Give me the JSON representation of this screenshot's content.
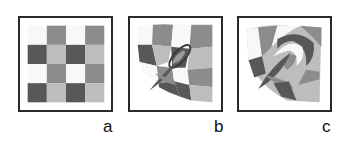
{
  "figure": {
    "panels": [
      {
        "id": "a",
        "label": "a",
        "description": "undistorted 4x4 checkerboard"
      },
      {
        "id": "b",
        "label": "b",
        "description": "checkerboard with moderate swirl distortion"
      },
      {
        "id": "c",
        "label": "c",
        "description": "checkerboard with strong swirl distortion"
      }
    ],
    "colors": {
      "white": "#f8f8f8",
      "mid": "#8c8c8c",
      "dark": "#585858",
      "light": "#bdbdbd",
      "border": "#2a2a2a"
    },
    "grid": {
      "rows": 4,
      "cols": 4,
      "pattern": [
        [
          "white",
          "mid",
          "white",
          "mid"
        ],
        [
          "dark",
          "light",
          "dark",
          "light"
        ],
        [
          "white",
          "mid",
          "white",
          "mid"
        ],
        [
          "dark",
          "light",
          "dark",
          "light"
        ]
      ]
    }
  }
}
